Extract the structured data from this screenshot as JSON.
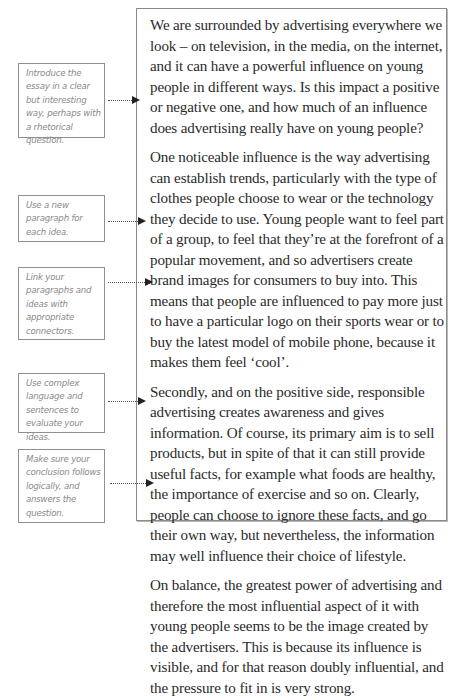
{
  "essay": {
    "paragraphs": [
      "We are surrounded by advertising everywhere we look – on television, in the media, on the internet, and it can have a powerful influence on young people in different ways.  Is this impact a positive or negative one, and how much of an influence does advertising really have on young people?",
      "One noticeable influence is the way advertising can establish trends, particularly with the type of clothes people choose to wear or the technology they decide to use. Young people want to feel part of a group, to feel that they’re at the forefront of a popular movement, and so advertisers create brand images for consumers to buy into. This means that people are influenced to pay more just to have a particular logo on their sports wear or to buy the latest model of mobile phone, because it makes them feel ‘cool’.",
      "Secondly, and on the positive side, responsible advertising creates awareness and gives information. Of course, its primary aim is to sell products, but in spite of that it can still provide useful facts, for example what foods are healthy, the importance of exercise and so on. Clearly, people can choose to ignore these facts, and go their own way, but nevertheless, the information may well influence their choice of lifestyle.",
      "On balance, the greatest power of advertising and therefore the most influential aspect of it with young people seems to be the image created by the advertisers. This is because its influence is visible, and for that reason doubly influential, and the pressure to fit in is very strong."
    ]
  },
  "notes": [
    {
      "text": "Introduce the essay in a clear but interesting way, perhaps with a rhetorical question."
    },
    {
      "text": "Use a new paragraph for each idea."
    },
    {
      "text": "Link your paragraphs and ideas with appropriate connectors."
    },
    {
      "text": "Use complex language and sentences to evaluate your ideas."
    },
    {
      "text": "Make sure your conclusion follows logically, and answers the question."
    }
  ]
}
